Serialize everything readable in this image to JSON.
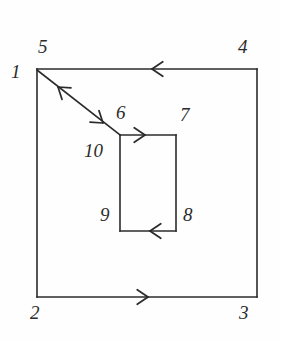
{
  "figure": {
    "type": "diagram",
    "background_color": "#fefefe",
    "stroke_color": "#2b2b2b",
    "label_color": "#2b2b2b",
    "canvas": {
      "width": 281,
      "height": 341
    },
    "outer_square": {
      "name": "outer-boundary-square",
      "left": 37,
      "top": 69,
      "right": 257,
      "bottom": 297
    },
    "inner_rectangle": {
      "name": "inner-hole-rectangle",
      "left": 120,
      "top": 135,
      "right": 176,
      "bottom": 231
    },
    "cut_line": {
      "name": "diagonal-cut-line",
      "x1": 37,
      "y1": 70,
      "x2": 120,
      "y2": 135
    },
    "labels": [
      {
        "id": "label-1",
        "text": "1",
        "x": 11,
        "y": 62,
        "node": "outer-top-left-vertex"
      },
      {
        "id": "label-5",
        "text": "5",
        "x": 38,
        "y": 37,
        "node": "outer-top-left-vertex-return"
      },
      {
        "id": "label-4",
        "text": "4",
        "x": 238,
        "y": 37,
        "node": "outer-top-right-vertex"
      },
      {
        "id": "label-6",
        "text": "6",
        "x": 116,
        "y": 103,
        "node": "inner-top-left-vertex"
      },
      {
        "id": "label-7",
        "text": "7",
        "x": 180,
        "y": 105,
        "node": "inner-top-right-vertex"
      },
      {
        "id": "label-10",
        "text": "10",
        "x": 84,
        "y": 141,
        "node": "inner-top-left-vertex-return"
      },
      {
        "id": "label-9",
        "text": "9",
        "x": 100,
        "y": 205,
        "node": "inner-bottom-left-vertex"
      },
      {
        "id": "label-8",
        "text": "8",
        "x": 183,
        "y": 205,
        "node": "inner-bottom-right-vertex"
      },
      {
        "id": "label-2",
        "text": "2",
        "x": 30,
        "y": 303,
        "node": "outer-bottom-left-vertex"
      },
      {
        "id": "label-3",
        "text": "3",
        "x": 239,
        "y": 303,
        "node": "outer-bottom-right-vertex"
      }
    ],
    "direction_arrows": [
      {
        "id": "arrow-outer-top",
        "on": "outer-top-edge",
        "x": 152,
        "y": 69,
        "direction": "left"
      },
      {
        "id": "arrow-outer-bottom",
        "on": "outer-bottom-edge",
        "x": 148,
        "y": 297,
        "direction": "right"
      },
      {
        "id": "arrow-cut-toward-1",
        "on": "diagonal-cut-line",
        "x": 58,
        "y": 87,
        "direction": "up-left"
      },
      {
        "id": "arrow-cut-toward-6",
        "on": "diagonal-cut-line",
        "x": 103,
        "y": 123,
        "direction": "down-right"
      },
      {
        "id": "arrow-inner-top",
        "on": "inner-top-edge",
        "x": 145,
        "y": 135,
        "direction": "right"
      },
      {
        "id": "arrow-inner-bottom",
        "on": "inner-bottom-edge",
        "x": 150,
        "y": 231,
        "direction": "left"
      }
    ]
  }
}
